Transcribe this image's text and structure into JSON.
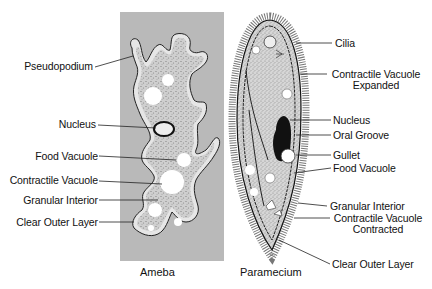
{
  "diagram": {
    "colors": {
      "ameba_panel": "#b9b9b9",
      "cytoplasm": "#d4d4d4",
      "outline": "#222222",
      "vacuole": "#ffffff",
      "label_text": "#111111"
    },
    "ameba": {
      "caption": "Ameba",
      "labels": [
        {
          "id": "pseudopodium",
          "text": "Pseudopodium"
        },
        {
          "id": "nucleus",
          "text": "Nucleus"
        },
        {
          "id": "food-vacuole",
          "text": "Food Vacuole"
        },
        {
          "id": "contractile-vacuole",
          "text": "Contractile Vacuole"
        },
        {
          "id": "granular-interior",
          "text": "Granular Interior"
        },
        {
          "id": "clear-outer-layer",
          "text": "Clear Outer Layer"
        }
      ]
    },
    "paramecium": {
      "caption": "Paramecium",
      "labels": [
        {
          "id": "cilia",
          "text": "Cilia"
        },
        {
          "id": "contractile-vacuole-expanded",
          "text": "Contractile Vacuole",
          "line2": "Expanded"
        },
        {
          "id": "nucleus",
          "text": "Nucleus"
        },
        {
          "id": "oral-groove",
          "text": "Oral Groove"
        },
        {
          "id": "gullet",
          "text": "Gullet"
        },
        {
          "id": "food-vacuole",
          "text": "Food Vacuole"
        },
        {
          "id": "granular-interior",
          "text": "Granular Interior"
        },
        {
          "id": "contractile-vacuole-contracted",
          "text": "Contractile Vacuole",
          "line2": "Contracted"
        },
        {
          "id": "clear-outer-layer",
          "text": "Clear Outer Layer"
        }
      ]
    }
  }
}
